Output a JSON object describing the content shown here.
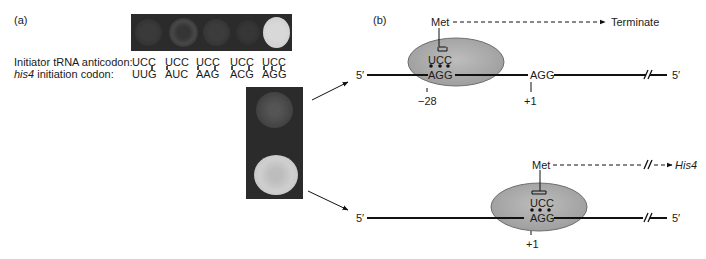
{
  "panel_a": {
    "label": "(a)",
    "row_labels": {
      "anticodon": "Initiator tRNA anticodon:",
      "codon_prefix_italic": "his4",
      "codon_suffix": " initiation codon:"
    },
    "columns": [
      {
        "anticodon": "UCC",
        "codon": "UUG",
        "colony": "dim"
      },
      {
        "anticodon": "UCC",
        "codon": "AUC",
        "colony": "faint"
      },
      {
        "anticodon": "UCC",
        "codon": "AAG",
        "colony": "dim"
      },
      {
        "anticodon": "UCC",
        "codon": "ACG",
        "colony": "dim"
      },
      {
        "anticodon": "UCC",
        "codon": "AGG",
        "colony": "bright"
      }
    ],
    "enlarged_plate": {
      "top_colony": "faint",
      "bottom_colony": "bright"
    }
  },
  "panel_b": {
    "label": "(b)",
    "top_diagram": {
      "five_prime_left": "5′",
      "five_prime_right": "5′",
      "anticodon": "UCC",
      "codon_in_ribosome": "AGG",
      "downstream_codon": "AGG",
      "position_ribosome": "−28",
      "position_downstream": "+1",
      "amino_acid": "Met",
      "outcome": "Terminate"
    },
    "bottom_diagram": {
      "five_prime_left": "5′",
      "five_prime_right": "5′",
      "anticodon": "UCC",
      "codon_in_ribosome": "AGG",
      "position_ribosome": "+1",
      "amino_acid": "Met",
      "outcome": "His4"
    }
  },
  "colors": {
    "ribosome_fill": "#a9a9a9",
    "ribosome_stroke": "#6e6e6e",
    "plate_bg": "#2a2a2a",
    "line": "#111111"
  }
}
